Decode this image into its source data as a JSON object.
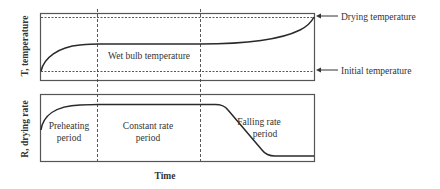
{
  "diagram": {
    "x_axis_label": "Time",
    "top_panel": {
      "y_axis_label": "T, temperature",
      "curve_label": "Wet bulb temperature",
      "annotations": [
        {
          "text": "Drying temperature",
          "arrow": "left"
        },
        {
          "text": "Initial temperature",
          "arrow": "left"
        }
      ]
    },
    "bottom_panel": {
      "y_axis_label": "R, drying rate",
      "periods": [
        {
          "line1": "Preheating",
          "line2": "period"
        },
        {
          "line1": "Constant rate",
          "line2": "period"
        },
        {
          "line1": "Falling rate",
          "line2": "period"
        }
      ]
    },
    "colors": {
      "line": "#2a2a2a",
      "box": "#555555",
      "background": "#ffffff"
    }
  }
}
